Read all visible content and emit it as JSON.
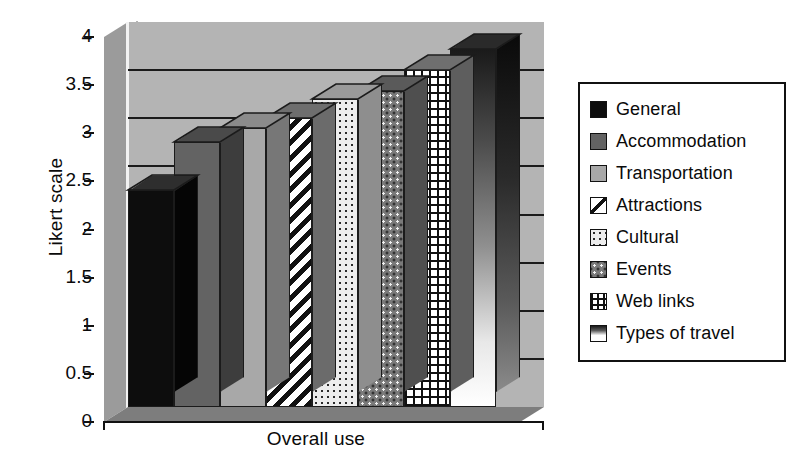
{
  "chart_data": {
    "type": "bar",
    "title": "",
    "xlabel": "Overall use",
    "ylabel": "Likert scale",
    "ylim": [
      0,
      4
    ],
    "ytick_labels": [
      "4",
      "3.5",
      "3",
      "2.5",
      "2",
      "1.5",
      "1",
      "0.5",
      "0"
    ],
    "ytick_values": [
      4,
      3.5,
      3,
      2.5,
      2,
      1.5,
      1,
      0.5,
      0
    ],
    "grid": true,
    "legend_position": "right",
    "style": "3d-column",
    "categories": [
      "General",
      "Accommodation",
      "Transportation",
      "Attractions",
      "Cultural",
      "Events",
      "Web links",
      "Types of travel"
    ],
    "values": [
      2.25,
      2.75,
      2.9,
      3.0,
      3.2,
      3.28,
      3.5,
      3.72
    ],
    "series": [
      {
        "name": "Overall use",
        "values": [
          2.25,
          2.75,
          2.9,
          3.0,
          3.2,
          3.28,
          3.5,
          3.72
        ]
      }
    ]
  },
  "axes": {
    "y_title": "Likert scale",
    "x_title": "Overall use",
    "ticks": [
      {
        "label": "4",
        "value": 4.0
      },
      {
        "label": "3.5",
        "value": 3.5
      },
      {
        "label": "3",
        "value": 3.0
      },
      {
        "label": "2.5",
        "value": 2.5
      },
      {
        "label": "2",
        "value": 2.0
      },
      {
        "label": "1.5",
        "value": 1.5
      },
      {
        "label": "1",
        "value": 1.0
      },
      {
        "label": "0.5",
        "value": 0.5
      },
      {
        "label": "0",
        "value": 0.0
      }
    ]
  },
  "legend": {
    "items": [
      {
        "label": "General",
        "swatch": "solid-black",
        "color": "#0d0d0d"
      },
      {
        "label": "Accommodation",
        "swatch": "solid-dark-gray",
        "color": "#636363"
      },
      {
        "label": "Transportation",
        "swatch": "solid-light-gray",
        "color": "#a8a8a8"
      },
      {
        "label": "Attractions",
        "swatch": "diagonal-stripes",
        "color": "#ffffff"
      },
      {
        "label": "Cultural",
        "swatch": "fine-dots-light",
        "color": "#ececec"
      },
      {
        "label": "Events",
        "swatch": "dots-medium-gray",
        "color": "#787878"
      },
      {
        "label": "Web links",
        "swatch": "crosshatch-grid",
        "color": "#ffffff"
      },
      {
        "label": "Types of travel",
        "swatch": "gradient-dark-light",
        "color": "#ffffff"
      }
    ]
  },
  "plot_area": {
    "backwall_color": "#b4b4b4",
    "sidewall_color": "#9b9b9b",
    "floor_color": "#7d7d7d",
    "gridline_color": "#1b1b1b"
  }
}
